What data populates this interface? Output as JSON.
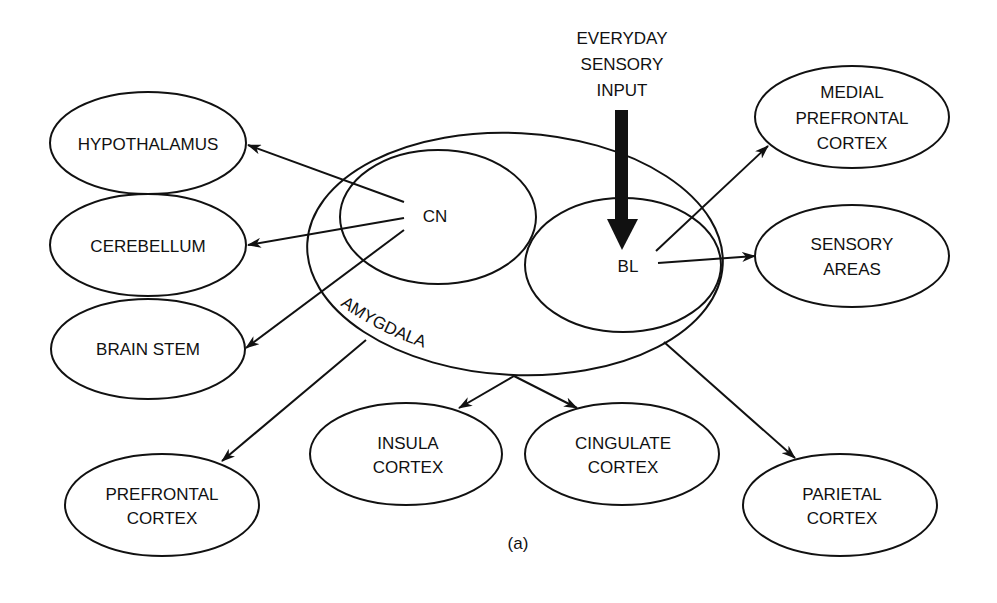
{
  "diagram": {
    "caption": "(a)",
    "input": {
      "lines": [
        "EVERYDAY",
        "SENSORY",
        "INPUT"
      ]
    },
    "amygdala": {
      "label": "AMYGDALA",
      "nuclei": {
        "cn": "CN",
        "bl": "BL"
      }
    },
    "targets": {
      "hypothalamus": [
        "HYPOTHALAMUS"
      ],
      "cerebellum": [
        "CEREBELLUM"
      ],
      "brain_stem": [
        "BRAIN STEM"
      ],
      "prefrontal": [
        "PREFRONTAL",
        "CORTEX"
      ],
      "insula": [
        "INSULA",
        "CORTEX"
      ],
      "cingulate": [
        "CINGULATE",
        "CORTEX"
      ],
      "parietal": [
        "PARIETAL",
        "CORTEX"
      ],
      "medial_prefrontal": [
        "MEDIAL",
        "PREFRONTAL",
        "CORTEX"
      ],
      "sensory_areas": [
        "SENSORY",
        "AREAS"
      ]
    },
    "connections": [
      {
        "from": "CN",
        "to": "HYPOTHALAMUS"
      },
      {
        "from": "CN",
        "to": "CEREBELLUM"
      },
      {
        "from": "CN",
        "to": "BRAIN STEM"
      },
      {
        "from": "AMYGDALA",
        "to": "PREFRONTAL CORTEX"
      },
      {
        "from": "AMYGDALA",
        "to": "INSULA CORTEX"
      },
      {
        "from": "AMYGDALA",
        "to": "CINGULATE CORTEX"
      },
      {
        "from": "AMYGDALA",
        "to": "PARIETAL CORTEX"
      },
      {
        "from": "BL",
        "to": "MEDIAL PREFRONTAL CORTEX"
      },
      {
        "from": "BL",
        "to": "SENSORY AREAS"
      },
      {
        "from": "EVERYDAY SENSORY INPUT",
        "to": "BL"
      }
    ]
  }
}
